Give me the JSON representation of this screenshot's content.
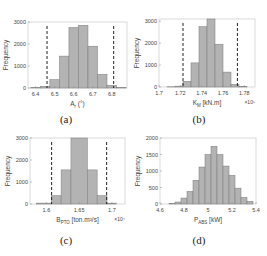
{
  "chart_data": [
    {
      "type": "bar",
      "id": "a",
      "caption": "(a)",
      "xlabel": "A_r (°)",
      "xlabel_main": "A",
      "xlabel_sub": "r",
      "xlabel_unit": " (°)",
      "ylabel": "Frequency",
      "xlim": [
        6.36,
        6.88
      ],
      "ylim": [
        0,
        3000
      ],
      "xticks": [
        6.4,
        6.5,
        6.6,
        6.7,
        6.8
      ],
      "xtick_labels": [
        "6.4",
        "6.5",
        "6.6",
        "6.7",
        "6.8"
      ],
      "yticks": [
        0,
        1000,
        2000,
        3000
      ],
      "ytick_labels": [
        "0",
        "1000",
        "2000",
        "3000"
      ],
      "exponent": "",
      "bins": [
        6.4,
        6.45,
        6.5,
        6.55,
        6.6,
        6.65,
        6.7,
        6.75,
        6.8,
        6.85
      ],
      "values": [
        20,
        80,
        380,
        1450,
        2750,
        2850,
        1900,
        620,
        120,
        20
      ],
      "dashed_lines": [
        6.46,
        6.81
      ]
    },
    {
      "type": "bar",
      "id": "b",
      "caption": "(b)",
      "xlabel": "K_M [kN.m]",
      "xlabel_main": "K",
      "xlabel_sub": "M",
      "xlabel_unit": " [kN.m]",
      "ylabel": "Frequency",
      "xlim": [
        1.7,
        1.79
      ],
      "ylim": [
        0,
        3100
      ],
      "xticks": [
        1.7,
        1.72,
        1.74,
        1.76,
        1.78
      ],
      "xtick_labels": [
        "1.7",
        "1.72",
        "1.74",
        "1.76",
        "1.78"
      ],
      "yticks": [
        0,
        1000,
        2000,
        3000
      ],
      "ytick_labels": [
        "0",
        "1000",
        "2000",
        "3000"
      ],
      "exponent": "×10⁵",
      "bins": [
        1.71,
        1.715,
        1.72,
        1.725,
        1.73,
        1.735,
        1.74,
        1.745,
        1.75,
        1.755,
        1.76,
        1.765,
        1.77,
        1.775,
        1.78
      ],
      "values": [
        0,
        10,
        40,
        260,
        1100,
        2750,
        3100,
        1950,
        680,
        120,
        30,
        0,
        0,
        0,
        0
      ],
      "bin_width": 0.0075,
      "bars": [
        [
          1.7075,
          1.715,
          10
        ],
        [
          1.715,
          1.7225,
          40
        ],
        [
          1.7225,
          1.73,
          260
        ],
        [
          1.73,
          1.7375,
          1100
        ],
        [
          1.7375,
          1.745,
          2750
        ],
        [
          1.745,
          1.7525,
          3100
        ],
        [
          1.7525,
          1.76,
          1950
        ],
        [
          1.76,
          1.7675,
          680
        ],
        [
          1.7675,
          1.775,
          120
        ],
        [
          1.775,
          1.7825,
          30
        ]
      ],
      "dashed_lines": [
        1.7225,
        1.7735
      ]
    },
    {
      "type": "bar",
      "id": "c",
      "caption": "(c)",
      "xlabel": "B_PTO [ton.m²/s]",
      "xlabel_main": "B",
      "xlabel_sub": "PTO",
      "xlabel_unit": " [ton.m²/s]",
      "ylabel": "Frequency",
      "xlim": [
        1.575,
        1.72
      ],
      "ylim": [
        0,
        3000
      ],
      "xticks": [
        1.6,
        1.65,
        1.7
      ],
      "xtick_labels": [
        "1.6",
        "1.65",
        "1.7"
      ],
      "yticks": [
        0,
        1000,
        2000,
        3000
      ],
      "ytick_labels": [
        "0",
        "1000",
        "2000",
        "3000"
      ],
      "exponent": "×10⁴",
      "bars": [
        [
          1.585,
          1.6075,
          40
        ],
        [
          1.6075,
          1.6225,
          380
        ],
        [
          1.6225,
          1.6375,
          1550
        ],
        [
          1.6375,
          1.6625,
          3000
        ],
        [
          1.6625,
          1.6775,
          1550
        ],
        [
          1.6775,
          1.6925,
          380
        ],
        [
          1.6925,
          1.707,
          40
        ]
      ],
      "dashed_lines": [
        1.608,
        1.692
      ]
    },
    {
      "type": "bar",
      "id": "d",
      "caption": "(d)",
      "xlabel": "P_ABS [kW]",
      "xlabel_main": "P",
      "xlabel_sub": "ABS",
      "xlabel_unit": " [kW]",
      "ylabel": "Frequency",
      "xlim": [
        4.6,
        5.4
      ],
      "ylim": [
        0,
        2000
      ],
      "xticks": [
        4.6,
        4.8,
        5.0,
        5.2,
        5.4
      ],
      "xtick_labels": [
        "4.6",
        "4.8",
        "5",
        "5.2",
        "5.4"
      ],
      "yticks": [
        0,
        500,
        1000,
        1500,
        2000
      ],
      "ytick_labels": [
        "0",
        "500",
        "1000",
        "1500",
        "2000"
      ],
      "exponent": "",
      "bars": [
        [
          4.675,
          4.725,
          10
        ],
        [
          4.725,
          4.775,
          60
        ],
        [
          4.775,
          4.825,
          180
        ],
        [
          4.825,
          4.875,
          380
        ],
        [
          4.875,
          4.925,
          720
        ],
        [
          4.925,
          4.975,
          1120
        ],
        [
          4.975,
          5.025,
          1500
        ],
        [
          5.025,
          5.075,
          1750
        ],
        [
          5.075,
          5.125,
          1500
        ],
        [
          5.125,
          5.175,
          1150
        ],
        [
          5.175,
          5.225,
          870
        ],
        [
          5.225,
          5.275,
          480
        ],
        [
          5.275,
          5.325,
          200
        ],
        [
          5.325,
          5.375,
          80
        ]
      ],
      "dashed_lines": []
    }
  ],
  "colors": {
    "bar_fill": "#b3b3b3",
    "bar_stroke": "#7a7a7a",
    "axis": "#cfcfcf",
    "text": "#444444",
    "dashed": "#222222"
  }
}
